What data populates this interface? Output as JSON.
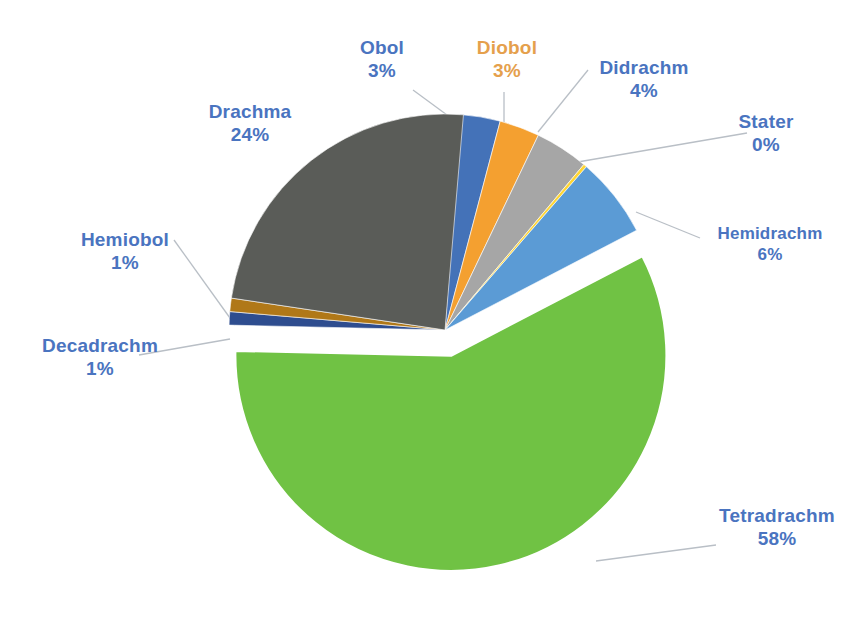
{
  "chart_data": {
    "type": "pie",
    "title": "",
    "subtitle": "",
    "xlabel": "",
    "ylabel": "",
    "legend_position": "none",
    "labels_show_percent": true,
    "exploded_slice": "Tetradrachm",
    "categories": [
      "Tetradrachm",
      "Drachma",
      "Hemidrachm",
      "Didrachm",
      "Obol",
      "Diobol",
      "Decadrachm",
      "Hemiobol",
      "Stater"
    ],
    "values": [
      58,
      24,
      6,
      4,
      3,
      3,
      1,
      1,
      0
    ],
    "slices": [
      {
        "name": "Tetradrachm",
        "percent": 58,
        "percent_label": "58%",
        "color": "#70c244",
        "label_color": "#4a74c0",
        "exploded": true
      },
      {
        "name": "Drachma",
        "percent": 24,
        "percent_label": "24%",
        "color": "#5a5c58",
        "label_color": "#4a74c0",
        "exploded": false
      },
      {
        "name": "Hemidrachm",
        "percent": 6,
        "percent_label": "6%",
        "color": "#5b9bd5",
        "label_color": "#4a74c0",
        "exploded": false
      },
      {
        "name": "Didrachm",
        "percent": 4,
        "percent_label": "4%",
        "color": "#a6a6a6",
        "label_color": "#4a74c0",
        "exploded": false
      },
      {
        "name": "Obol",
        "percent": 3,
        "percent_label": "3%",
        "color": "#4472b8",
        "label_color": "#4a74c0",
        "exploded": false
      },
      {
        "name": "Diobol",
        "percent": 3,
        "percent_label": "3%",
        "color": "#f4a030",
        "label_color": "#e5a04c",
        "exploded": false
      },
      {
        "name": "Decadrachm",
        "percent": 1,
        "percent_label": "1%",
        "color": "#2e4d8f",
        "label_color": "#4a74c0",
        "exploded": false
      },
      {
        "name": "Hemiobol",
        "percent": 1,
        "percent_label": "1%",
        "color": "#b07818",
        "label_color": "#4a74c0",
        "exploded": false
      },
      {
        "name": "Stater",
        "percent": 0,
        "percent_label": "0%",
        "color": "#ffd633",
        "label_color": "#4a74c0",
        "exploded": false
      }
    ]
  },
  "labels": {
    "drachma": {
      "name": "Drachma",
      "percent": "24%"
    },
    "obol": {
      "name": "Obol",
      "percent": "3%"
    },
    "diobol": {
      "name": "Diobol",
      "percent": "3%"
    },
    "didrachm": {
      "name": "Didrachm",
      "percent": "4%"
    },
    "stater": {
      "name": "Stater",
      "percent": "0%"
    },
    "hemidrachm": {
      "name": "Hemidrachm",
      "percent": "6%"
    },
    "tetradrachm": {
      "name": "Tetradrachm",
      "percent": "58%"
    },
    "hemiobol": {
      "name": "Hemiobol",
      "percent": "1%"
    },
    "decadrachm": {
      "name": "Decadrachm",
      "percent": "1%"
    }
  },
  "colors": {
    "background": "#ffffff",
    "label_blue": "#4a74c0",
    "label_orange": "#e5a04c",
    "leader_line": "#b9bfc6"
  }
}
